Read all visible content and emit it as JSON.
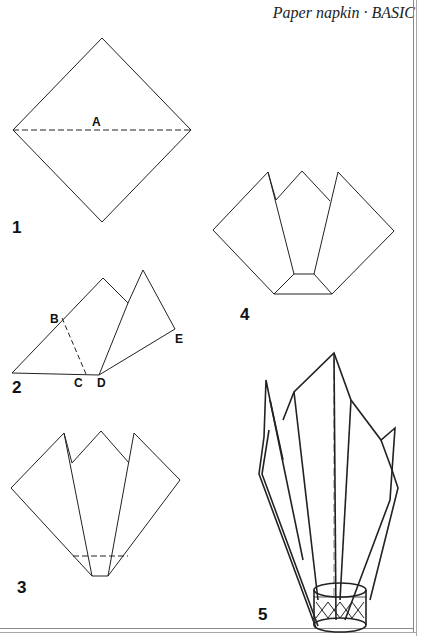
{
  "header": {
    "title": "Paper napkin · BASIC"
  },
  "steps": [
    {
      "number": "1",
      "labels": [
        "A"
      ]
    },
    {
      "number": "2",
      "labels": [
        "B",
        "C",
        "D",
        "E"
      ]
    },
    {
      "number": "3",
      "labels": []
    },
    {
      "number": "4",
      "labels": []
    },
    {
      "number": "5",
      "labels": []
    }
  ]
}
